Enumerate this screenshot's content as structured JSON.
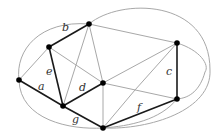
{
  "diagram": {
    "type": "graph",
    "nodes": [
      {
        "id": "n1",
        "x": 19,
        "y": 80
      },
      {
        "id": "n2",
        "x": 49,
        "y": 47
      },
      {
        "id": "n3",
        "x": 89,
        "y": 24
      },
      {
        "id": "n4",
        "x": 63,
        "y": 106
      },
      {
        "id": "n5",
        "x": 103,
        "y": 83
      },
      {
        "id": "n6",
        "x": 103,
        "y": 128
      },
      {
        "id": "n7",
        "x": 177,
        "y": 43
      },
      {
        "id": "n8",
        "x": 177,
        "y": 99
      }
    ],
    "labeled_edges": [
      {
        "label": "a",
        "from": "n1",
        "to": "n4",
        "label_x": 38,
        "label_y": 90
      },
      {
        "label": "b",
        "from": "n2",
        "to": "n3",
        "label_x": 62,
        "label_y": 31
      },
      {
        "label": "c",
        "from": "n7",
        "to": "n8",
        "label_x": 166,
        "label_y": 75
      },
      {
        "label": "d",
        "from": "n4",
        "to": "n5",
        "label_x": 79,
        "label_y": 91
      },
      {
        "label": "e",
        "from": "n2",
        "to": "n4",
        "label_x": 46,
        "label_y": 75
      },
      {
        "label": "f",
        "from": "n6",
        "to": "n8",
        "label_x": 137,
        "label_y": 111
      },
      {
        "label": "g",
        "from": "n4",
        "to": "n6",
        "label_x": 72,
        "label_y": 123
      }
    ],
    "colors": {
      "highlight_edge": "#1a1a1a",
      "other_edge": "#a8a8a8",
      "node": "#000000",
      "label": "#333333"
    }
  }
}
